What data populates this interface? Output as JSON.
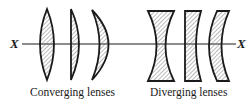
{
  "diagram": {
    "axis_label_left": "X",
    "axis_label_right": "X",
    "groups": [
      {
        "caption": "Converging lenses",
        "lenses": [
          "biconvex",
          "plano-convex",
          "convex-meniscus"
        ]
      },
      {
        "caption": "Diverging lenses",
        "lenses": [
          "biconcave",
          "plano-concave",
          "concave-meniscus"
        ]
      }
    ],
    "colors": {
      "stroke": "#1a1a1a",
      "hatch": "#555555",
      "background": "#ffffff"
    }
  }
}
